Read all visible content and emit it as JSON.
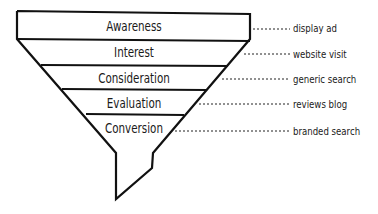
{
  "diagram": {
    "type": "funnel",
    "stages": [
      {
        "label": "Awareness",
        "channel": "display ad"
      },
      {
        "label": "Interest",
        "channel": "website visit"
      },
      {
        "label": "Consideration",
        "channel": "generic search"
      },
      {
        "label": "Evaluation",
        "channel": "reviews blog"
      },
      {
        "label": "Conversion",
        "channel": "branded search"
      }
    ],
    "colors": {
      "stroke": "#111111",
      "fill": "#ffffff",
      "text": "#1a1a1a"
    }
  }
}
